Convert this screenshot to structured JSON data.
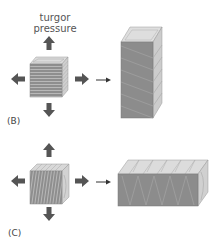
{
  "diagram": {
    "annotation": {
      "line1": "turgor",
      "line2": "pressure"
    },
    "panels": [
      {
        "id": "B",
        "label": "(B)",
        "fiber_orientation": "horizontal",
        "result_shape": "tall-column"
      },
      {
        "id": "C",
        "label": "(C)",
        "fiber_orientation": "vertical",
        "result_shape": "long-horizontal-box"
      }
    ],
    "colors": {
      "arrow": "#555555",
      "front_face": "#8c8c8c",
      "side_face": "#c8c8c8",
      "top_face": "#dcdcdc",
      "stripe": "#b5b5b5"
    }
  }
}
